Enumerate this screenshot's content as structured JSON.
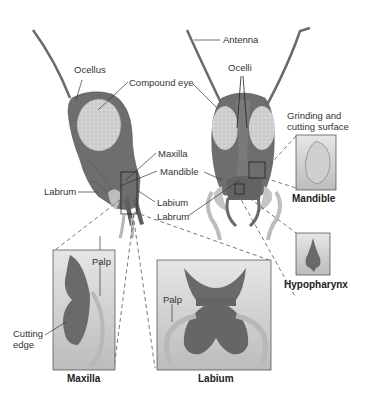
{
  "diagram": {
    "colors": {
      "head": "#6e6e6e",
      "head_dark": "#5a5a5a",
      "eye": "#c8c8c8",
      "part": "#6a6a6a",
      "palp": "#b9b9b9",
      "box_bg_top": "#e4e4e4",
      "box_bg_bottom": "#bdbdbd",
      "line": "#333333",
      "dash": "#555555"
    },
    "labels": {
      "ocellus": "Ocellus",
      "compound_eye": "Compound eye",
      "antenna": "Antenna",
      "ocelli": "Ocelli",
      "maxilla": "Maxilla",
      "mandible": "Mandible",
      "labium": "Labium",
      "labrum_left": "Labrum",
      "labrum_center": "Labrum",
      "grinding_line1": "Grinding and",
      "grinding_line2": "cutting surface",
      "palp_maxilla": "Palp",
      "palp_labium": "Palp",
      "cutting_line1": "Cutting",
      "cutting_line2": "edge"
    },
    "captions": {
      "maxilla": "Maxilla",
      "labium": "Labium",
      "mandible": "Mandible",
      "hypopharynx": "Hypopharynx"
    }
  }
}
